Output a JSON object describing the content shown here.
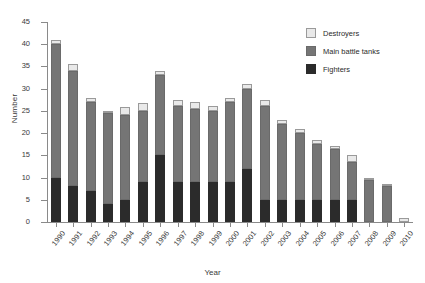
{
  "chart_data": {
    "type": "bar",
    "stacked": true,
    "title": "",
    "xlabel": "Year",
    "ylabel": "Number",
    "ylim": [
      0,
      45
    ],
    "ytick_step": 5,
    "yticks": [
      0,
      5,
      10,
      15,
      20,
      25,
      30,
      35,
      40,
      45
    ],
    "grid": false,
    "legend_position": "top-right",
    "categories": [
      "1990",
      "1991",
      "1992",
      "1993",
      "1994",
      "1995",
      "1996",
      "1997",
      "1998",
      "1999",
      "2000",
      "2001",
      "2002",
      "2003",
      "2004",
      "2005",
      "2006",
      "2007",
      "2008",
      "2009",
      "2010"
    ],
    "series": [
      {
        "name": "Fighters",
        "color": "#2b2b2b",
        "values": [
          10,
          8,
          7,
          4,
          5,
          9,
          15,
          9,
          9,
          9,
          9,
          12,
          5,
          5,
          5,
          5,
          5,
          5,
          0,
          0,
          0
        ]
      },
      {
        "name": "Main battle tanks",
        "color": "#757575",
        "values": [
          30,
          26,
          20,
          20.5,
          19,
          16,
          18,
          17,
          16.5,
          16,
          18,
          18,
          21,
          17,
          15,
          12.5,
          11.5,
          8.5,
          9.5,
          8,
          0
        ]
      },
      {
        "name": "Destroyers",
        "color": "#e9e9e9",
        "values": [
          1,
          1.5,
          0.8,
          0.5,
          1.8,
          1.8,
          1,
          1.5,
          1.5,
          1,
          1,
          1,
          1.5,
          1,
          1,
          1,
          0.5,
          1.5,
          0.5,
          0.5,
          1
        ]
      }
    ],
    "totals": [
      41,
      35.5,
      27.8,
      25,
      25.8,
      26.8,
      34,
      27.5,
      27,
      26,
      28,
      31,
      27.5,
      23,
      21,
      18.5,
      17,
      15,
      10,
      8.5,
      1
    ]
  },
  "legend": {
    "items": [
      {
        "label": "Destroyers",
        "swatch": "destroyers-swatch"
      },
      {
        "label": "Main battle tanks",
        "swatch": "tanks-swatch"
      },
      {
        "label": "Fighters",
        "swatch": "fighters-swatch"
      }
    ]
  }
}
